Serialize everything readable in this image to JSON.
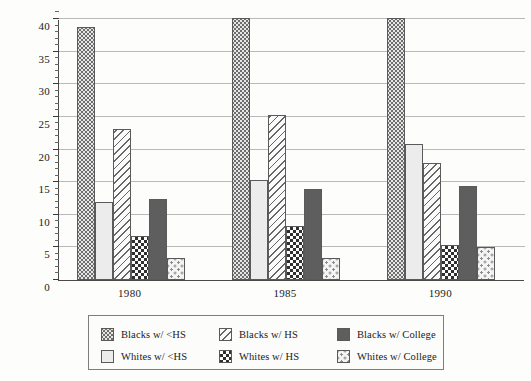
{
  "chart_data": {
    "type": "bar",
    "title": "",
    "xlabel": "",
    "ylabel": "",
    "categories": [
      "1980",
      "1985",
      "1990"
    ],
    "ylim": [
      0,
      40
    ],
    "yticks": [
      0,
      5,
      10,
      15,
      20,
      25,
      30,
      35,
      40
    ],
    "ytick_labels": [
      "0",
      "5",
      "10",
      "15",
      "20",
      "25",
      "30",
      "35",
      "40"
    ],
    "minor_tick_interval": 1,
    "grid": true,
    "legend_position": "below-center",
    "note": "Tallest bars (Blacks w/ <HS) exceed the plotted axis maximum of 40 in 1985 and 1990 and are clipped at the top of the frame.",
    "series": [
      {
        "name": "Blacks w/ <HS",
        "pattern": "dense-stipple",
        "values": [
          38.7,
          40.5,
          40.5
        ]
      },
      {
        "name": "Whites w/ <HS",
        "pattern": "light-solid",
        "values": [
          12.0,
          15.3,
          20.8
        ]
      },
      {
        "name": "Blacks w/ HS",
        "pattern": "diagonal-hatch",
        "values": [
          23.2,
          25.3,
          18.0
        ]
      },
      {
        "name": "Whites w/ HS",
        "pattern": "checkerboard",
        "values": [
          6.7,
          8.3,
          5.3
        ]
      },
      {
        "name": "Blacks w/ College",
        "pattern": "dark-solid",
        "values": [
          12.4,
          13.9,
          14.4
        ]
      },
      {
        "name": "Whites w/ College",
        "pattern": "sparse-dots",
        "values": [
          3.4,
          3.4,
          5.0
        ]
      }
    ]
  },
  "legend": {
    "entries": [
      {
        "label": "Blacks w/ <HS"
      },
      {
        "label": "Whites w/ <HS"
      },
      {
        "label": "Blacks w/ HS"
      },
      {
        "label": "Whites w/ HS"
      },
      {
        "label": "Blacks w/ College"
      },
      {
        "label": "Whites w/ College"
      }
    ]
  },
  "colors": {
    "axis": "#4a4a4a",
    "gridline": "#b9b9b9",
    "text": "#1a1a1a",
    "background": "#fdfdfc",
    "dark_solid": "#5e5e5e",
    "light_solid": "#ececed"
  }
}
